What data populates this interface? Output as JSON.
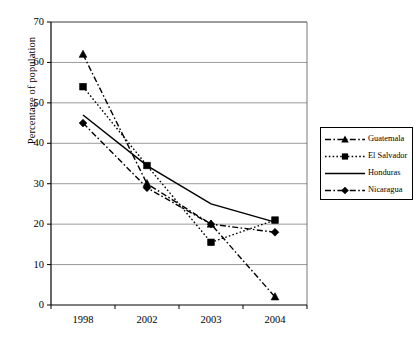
{
  "chart_data": {
    "type": "line",
    "title": "",
    "subtitle": "",
    "xlabel": "",
    "ylabel": "Percentage of population",
    "categories": [
      "1998",
      "2002",
      "2003",
      "2004"
    ],
    "ylim": [
      0,
      70
    ],
    "yticks": [
      0,
      10,
      20,
      30,
      40,
      50,
      60,
      70
    ],
    "grid": "horizontal",
    "legend_position": "right",
    "series": [
      {
        "name": "Guatemala",
        "marker": "triangle",
        "line_style": "dash-dot",
        "color": "#000000",
        "values": [
          62,
          30,
          20,
          2
        ]
      },
      {
        "name": "El Salvador",
        "marker": "square",
        "line_style": "dotted",
        "color": "#000000",
        "values": [
          54,
          34.5,
          15.5,
          21
        ]
      },
      {
        "name": "Honduras",
        "marker": "none",
        "line_style": "solid",
        "color": "#000000",
        "values": [
          47,
          34.5,
          25,
          20.5
        ]
      },
      {
        "name": "Nicaragua",
        "marker": "diamond",
        "line_style": "dash-dot",
        "color": "#000000",
        "values": [
          45,
          29,
          20,
          18
        ]
      }
    ]
  },
  "axes": {
    "ytick_labels": [
      "70",
      "60",
      "50",
      "40",
      "30",
      "20",
      "10",
      "0"
    ],
    "xtick_labels": [
      "1998",
      "2002",
      "2003",
      "2004"
    ]
  },
  "legend": {
    "entries": [
      {
        "label": "Guatemala"
      },
      {
        "label": "El Salvador"
      },
      {
        "label": "Honduras"
      },
      {
        "label": "Nicaragua"
      }
    ]
  }
}
